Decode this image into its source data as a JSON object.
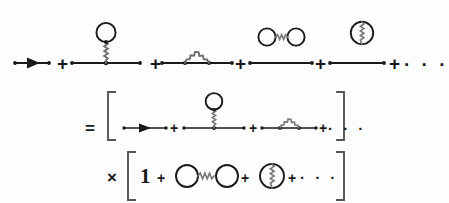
{
  "figure": {
    "kind": "feynman-diagram-equation",
    "canvas": {
      "width": 449,
      "height": 203,
      "background": "#fdfdfd"
    },
    "ink_color": "#1a1a1a",
    "wavy_color": "#6f6f6f"
  },
  "operators": {
    "plus": "+",
    "equals": "=",
    "times": "×",
    "one": "1",
    "ellipsis": "· · ·"
  },
  "rows": [
    {
      "id": "row-1",
      "name": "full-propagator-series",
      "baseline_y": 63,
      "terms": [
        {
          "id": "t1",
          "name": "bare-propagator",
          "type": "directed-line",
          "x": 15,
          "x2": 49
        },
        {
          "id": "t2",
          "name": "tadpole-diagram",
          "type": "line-with-tadpole",
          "x": 72,
          "x2": 140
        },
        {
          "id": "t3",
          "name": "rainbow-self-energy-diagram",
          "type": "line-with-wavy-arc",
          "x": 162,
          "x2": 232
        },
        {
          "id": "t4",
          "name": "dumbbell-vacuum-over-line",
          "type": "line-with-floating-dumbbell",
          "x": 250,
          "x2": 312
        },
        {
          "id": "t5",
          "name": "split-bubble-vacuum-over-line",
          "type": "line-with-floating-split-bubble",
          "x": 330,
          "x2": 384
        }
      ],
      "plus_x": [
        62,
        155,
        240,
        320,
        390
      ],
      "ellipsis_x": 404
    },
    {
      "id": "row-2",
      "name": "connected-diagrams-bracket",
      "baseline_y": 128,
      "prefix_symbol": "=",
      "prefix_x": 88,
      "bracket": {
        "left_x": 108,
        "right_x": 344,
        "top_y": 92,
        "bottom_y": 140
      },
      "terms": [
        {
          "id": "c1",
          "name": "bare-propagator",
          "type": "directed-line",
          "x": 124,
          "x2": 166
        },
        {
          "id": "c2",
          "name": "tadpole-diagram",
          "type": "line-with-tadpole",
          "x": 184,
          "x2": 244
        },
        {
          "id": "c3",
          "name": "rainbow-self-energy-diagram",
          "type": "line-with-wavy-arc",
          "x": 262,
          "x2": 316
        }
      ],
      "plus_x": [
        174,
        252,
        322
      ],
      "ellipsis_x": 330
    },
    {
      "id": "row-3",
      "name": "vacuum-diagrams-bracket",
      "baseline_y": 178,
      "prefix_symbol": "×",
      "prefix_x": 110,
      "bracket": {
        "left_x": 128,
        "right_x": 344,
        "top_y": 152,
        "bottom_y": 200
      },
      "terms": [
        {
          "id": "v0",
          "name": "unity-term",
          "type": "numeral-one",
          "x": 141
        },
        {
          "id": "v1",
          "name": "dumbbell-vacuum-diagram",
          "type": "dumbbell",
          "x": 176,
          "x2": 238
        },
        {
          "id": "v2",
          "name": "split-bubble-vacuum-diagram",
          "type": "split-bubble",
          "x": 256,
          "x2": 288
        }
      ],
      "plus_x": [
        161,
        244,
        295
      ],
      "ellipsis_x": 306
    }
  ]
}
